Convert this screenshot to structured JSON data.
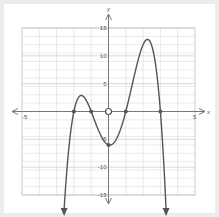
{
  "chart_data": {
    "type": "line",
    "title": "",
    "xlabel": "x",
    "ylabel": "y",
    "xlim": [
      -5,
      5
    ],
    "ylim": [
      -15,
      15
    ],
    "grid": true,
    "x_ticks_labeled": [
      -5,
      5
    ],
    "y_ticks_labeled": [
      15,
      10,
      5,
      -5,
      -10,
      -15
    ],
    "x_tick_labels": [
      "-5",
      "5"
    ],
    "y_tick_labels": [
      "15",
      "10",
      "5",
      "-5",
      "-10",
      "-15"
    ],
    "function": "f(x) = -(x+2)(x+1)(x-1)(x-3)",
    "series": [
      {
        "name": "f(x)",
        "x": [
          -2.25,
          -2,
          -1.75,
          -1.5,
          -1.25,
          -1,
          -0.5,
          0,
          0.5,
          1,
          1.5,
          2,
          2.5,
          3,
          3.2
        ],
        "values": [
          -5.0,
          0,
          2.4,
          2.8,
          1.9,
          0,
          -3.9,
          -6,
          -4.4,
          0,
          6.6,
          12,
          10.1,
          0,
          -10.6
        ]
      }
    ],
    "key_points": {
      "x_intercepts": [
        -2,
        -1,
        1,
        3
      ],
      "y_intercept": -6,
      "local_max": [
        [
          -1.5,
          2.8
        ],
        [
          2.1,
          12.9
        ]
      ],
      "local_min": [
        [
          0,
          -6
        ]
      ]
    },
    "open_circle_at": [
      0,
      0
    ],
    "end_behavior": "both ends point downward (arrows)"
  },
  "colors": {
    "curve": "#555555",
    "axis": "#777777",
    "grid": "#d9d9d9",
    "grid_major": "#c8c8c8",
    "background": "#ffffff",
    "frame": "#ececec"
  }
}
